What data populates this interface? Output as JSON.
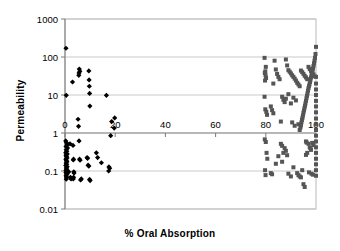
{
  "chart_data": {
    "type": "scatter",
    "title": "",
    "xlabel": "% Oral Absorption",
    "ylabel": "Permeability",
    "xlim": [
      0,
      100
    ],
    "ylim": [
      0.01,
      1000
    ],
    "yscale": "log",
    "xscale": "linear",
    "grid": true,
    "grid_axis": "y",
    "legend": "none",
    "xticks": [
      0,
      20,
      40,
      60,
      80,
      100
    ],
    "xtick_labels": [
      "0",
      "20",
      "40",
      "60",
      "80",
      "100"
    ],
    "yticks": [
      0.01,
      0.1,
      1,
      10,
      100,
      1000
    ],
    "ytick_labels": [
      "0.01",
      "0.1",
      "1",
      "10",
      "100",
      "1000"
    ],
    "series": [
      {
        "name": "low-absorption-group",
        "marker": "diamond",
        "color": "#000000",
        "size": 4,
        "points": [
          [
            0.4,
            170
          ],
          [
            0.5,
            9.8
          ],
          [
            3.0,
            22
          ],
          [
            5.5,
            33
          ],
          [
            5.7,
            48
          ],
          [
            5.9,
            42
          ],
          [
            5.6,
            38
          ],
          [
            9.5,
            43
          ],
          [
            9.6,
            25
          ],
          [
            9.7,
            17
          ],
          [
            9.8,
            11
          ],
          [
            9.9,
            5.1
          ],
          [
            16.5,
            9.8
          ],
          [
            5.2,
            2.3
          ],
          [
            5.4,
            1.5
          ],
          [
            5.6,
            0.62
          ],
          [
            18.6,
            2.0
          ],
          [
            19.8,
            2.5
          ],
          [
            19.6,
            1.35
          ],
          [
            18.2,
            0.85
          ],
          [
            0.3,
            0.62
          ],
          [
            0.6,
            0.55
          ],
          [
            0.8,
            0.48
          ],
          [
            0.4,
            0.44
          ],
          [
            1.0,
            0.4
          ],
          [
            0.5,
            0.36
          ],
          [
            0.7,
            0.33
          ],
          [
            0.3,
            0.3
          ],
          [
            0.9,
            0.28
          ],
          [
            0.4,
            0.26
          ],
          [
            0.6,
            0.24
          ],
          [
            0.8,
            0.22
          ],
          [
            0.35,
            0.205
          ],
          [
            0.55,
            0.19
          ],
          [
            0.75,
            0.175
          ],
          [
            0.45,
            0.162
          ],
          [
            0.65,
            0.15
          ],
          [
            0.3,
            0.14
          ],
          [
            0.85,
            0.13
          ],
          [
            0.5,
            0.12
          ],
          [
            0.7,
            0.112
          ],
          [
            0.4,
            0.104
          ],
          [
            0.6,
            0.097
          ],
          [
            0.35,
            0.09
          ],
          [
            0.8,
            0.083
          ],
          [
            0.45,
            0.077
          ],
          [
            0.55,
            0.071
          ],
          [
            0.65,
            0.066
          ],
          [
            0.5,
            0.061
          ],
          [
            3.2,
            0.47
          ],
          [
            3.4,
            0.205
          ],
          [
            3.3,
            0.195
          ],
          [
            3.5,
            0.095
          ],
          [
            3.6,
            0.088
          ],
          [
            3.4,
            0.068
          ],
          [
            3.3,
            0.062
          ],
          [
            5.8,
            0.205
          ],
          [
            6.0,
            0.192
          ],
          [
            8.8,
            0.225
          ],
          [
            9.0,
            0.215
          ],
          [
            9.2,
            0.142
          ],
          [
            9.5,
            0.135
          ],
          [
            9.8,
            0.06
          ],
          [
            10.0,
            0.056
          ],
          [
            12.5,
            0.3
          ],
          [
            13.0,
            0.225
          ],
          [
            14.5,
            0.165
          ],
          [
            17.5,
            0.128
          ],
          [
            17.8,
            0.118
          ],
          [
            17.4,
            0.1
          ],
          [
            2.0,
            0.52
          ],
          [
            1.5,
            0.095
          ],
          [
            2.2,
            0.068
          ],
          [
            2.4,
            0.062
          ],
          [
            6.5,
            0.062
          ],
          [
            6.2,
            0.058
          ]
        ]
      },
      {
        "name": "high-absorption-group",
        "marker": "square",
        "color": "#555555",
        "size": 4,
        "points": [
          [
            79.5,
            95
          ],
          [
            80.0,
            55
          ],
          [
            79.8,
            42
          ],
          [
            79.6,
            38
          ],
          [
            79.9,
            33
          ],
          [
            80.1,
            28
          ],
          [
            79.7,
            24
          ],
          [
            83.5,
            80
          ],
          [
            84.0,
            47
          ],
          [
            84.5,
            36
          ],
          [
            85.0,
            30
          ],
          [
            85.5,
            26
          ],
          [
            83.0,
            20
          ],
          [
            88.0,
            86
          ],
          [
            88.5,
            60
          ],
          [
            89.0,
            45
          ],
          [
            89.5,
            41
          ],
          [
            90.0,
            37
          ],
          [
            90.5,
            33
          ],
          [
            91.0,
            30
          ],
          [
            91.5,
            27
          ],
          [
            92.0,
            24
          ],
          [
            92.5,
            21
          ],
          [
            93.0,
            19
          ],
          [
            93.5,
            17
          ],
          [
            94.0,
            44
          ],
          [
            94.5,
            40
          ],
          [
            95.0,
            36
          ],
          [
            95.5,
            32
          ],
          [
            96.0,
            29
          ],
          [
            96.5,
            26
          ],
          [
            97.0,
            55
          ],
          [
            97.5,
            48
          ],
          [
            98.0,
            43
          ],
          [
            98.5,
            39
          ],
          [
            99.0,
            35
          ],
          [
            99.5,
            31
          ],
          [
            100.0,
            185
          ],
          [
            99.8,
            120
          ],
          [
            99.6,
            95
          ],
          [
            99.4,
            80
          ],
          [
            99.2,
            68
          ],
          [
            99.0,
            58
          ],
          [
            98.8,
            50
          ],
          [
            98.6,
            44
          ],
          [
            98.4,
            38
          ],
          [
            98.2,
            33
          ],
          [
            98.0,
            29
          ],
          [
            97.8,
            25
          ],
          [
            97.6,
            22
          ],
          [
            97.4,
            19
          ],
          [
            97.2,
            17
          ],
          [
            97.0,
            15
          ],
          [
            96.8,
            13
          ],
          [
            96.6,
            11
          ],
          [
            96.4,
            9.5
          ],
          [
            96.2,
            8.2
          ],
          [
            96.0,
            7.0
          ],
          [
            95.8,
            6.0
          ],
          [
            95.6,
            5.2
          ],
          [
            95.4,
            4.5
          ],
          [
            95.2,
            3.9
          ],
          [
            95.0,
            3.4
          ],
          [
            94.8,
            2.9
          ],
          [
            94.6,
            2.5
          ],
          [
            94.4,
            2.2
          ],
          [
            94.2,
            1.9
          ],
          [
            94.0,
            1.6
          ],
          [
            93.8,
            1.4
          ],
          [
            93.5,
            1.2
          ],
          [
            100.0,
            30
          ],
          [
            100.0,
            20
          ],
          [
            100.0,
            14
          ],
          [
            100.0,
            10
          ],
          [
            100.0,
            7
          ],
          [
            100.0,
            5
          ],
          [
            100.0,
            3.5
          ],
          [
            100.0,
            2.4
          ],
          [
            100.0,
            1.7
          ],
          [
            100.0,
            1.2
          ],
          [
            100.0,
            0.85
          ],
          [
            100.0,
            0.6
          ],
          [
            100.0,
            0.42
          ],
          [
            100.0,
            0.3
          ],
          [
            100.0,
            0.21
          ],
          [
            100.0,
            0.15
          ],
          [
            100.0,
            0.105
          ],
          [
            100.0,
            0.075
          ],
          [
            79.5,
            9.0
          ],
          [
            79.8,
            4.2
          ],
          [
            80.2,
            3.6
          ],
          [
            80.5,
            3.0
          ],
          [
            82.0,
            5.0
          ],
          [
            82.5,
            4.0
          ],
          [
            83.0,
            3.3
          ],
          [
            86.5,
            9.0
          ],
          [
            87.0,
            7.5
          ],
          [
            87.5,
            6.5
          ],
          [
            88.0,
            8.0
          ],
          [
            89.0,
            10.5
          ],
          [
            90.0,
            6.0
          ],
          [
            91.0,
            8.5
          ],
          [
            92.0,
            7.2
          ],
          [
            86.0,
            2.0
          ],
          [
            90.5,
            1.9
          ],
          [
            91.5,
            1.55
          ],
          [
            93.0,
            1.7
          ],
          [
            79.6,
            0.68
          ],
          [
            80.0,
            0.58
          ],
          [
            80.3,
            0.3
          ],
          [
            80.6,
            0.21
          ],
          [
            79.7,
            0.105
          ],
          [
            79.9,
            0.078
          ],
          [
            82.0,
            0.088
          ],
          [
            82.5,
            0.082
          ],
          [
            84.0,
            0.155
          ],
          [
            85.0,
            0.245
          ],
          [
            86.0,
            0.52
          ],
          [
            86.5,
            0.46
          ],
          [
            87.5,
            0.4
          ],
          [
            88.0,
            0.34
          ],
          [
            88.5,
            0.26
          ],
          [
            89.0,
            0.085
          ],
          [
            90.0,
            0.072
          ],
          [
            91.0,
            0.125
          ],
          [
            92.5,
            0.088
          ],
          [
            93.0,
            0.078
          ],
          [
            93.5,
            0.072
          ],
          [
            94.0,
            0.068
          ],
          [
            94.5,
            0.105
          ],
          [
            95.0,
            0.045
          ],
          [
            95.5,
            0.038
          ],
          [
            96.0,
            0.265
          ],
          [
            96.5,
            0.3
          ],
          [
            97.0,
            0.52
          ],
          [
            97.5,
            0.42
          ],
          [
            97.8,
            0.4
          ],
          [
            98.0,
            0.36
          ],
          [
            98.5,
            0.55
          ],
          [
            99.0,
            0.48
          ],
          [
            96.0,
            0.6
          ],
          [
            96.3,
            0.56
          ],
          [
            97.2,
            0.092
          ],
          [
            98.2,
            0.085
          ],
          [
            98.8,
            0.08
          ],
          [
            86.5,
            0.175
          ],
          [
            87.0,
            0.3
          ]
        ]
      }
    ]
  }
}
